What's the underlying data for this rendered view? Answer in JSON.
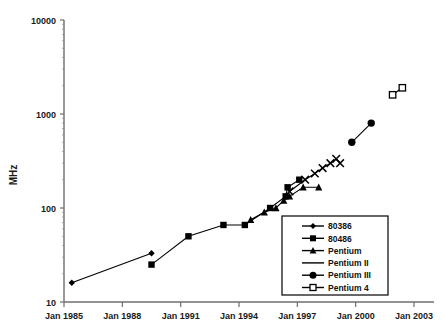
{
  "chart_data": {
    "type": "line",
    "title": "",
    "xlabel": "",
    "ylabel": "MHz",
    "yscale": "log",
    "ylim": [
      10,
      10000
    ],
    "ytick_labels": [
      "10000",
      "1000",
      "100",
      "10"
    ],
    "ytick_values": [
      10000,
      1000,
      100,
      10
    ],
    "xlim": [
      "Jan 1985",
      "Jan 2003"
    ],
    "xtick_labels": [
      "Jan 1985",
      "Jan 1988",
      "Jan 1991",
      "Jan 1994",
      "Jan 1997",
      "Jan 2000",
      "Jan 2003"
    ],
    "xtick_years": [
      1985,
      1988,
      1991,
      1994,
      1997,
      2000,
      2003
    ],
    "grid": false,
    "legend_position": "lower-right",
    "series": [
      {
        "name": "80386",
        "marker": "diamond",
        "points": [
          {
            "year": 1985.4,
            "mhz": 16
          },
          {
            "year": 1989.5,
            "mhz": 33
          }
        ]
      },
      {
        "name": "80486",
        "marker": "square",
        "points": [
          {
            "year": 1989.5,
            "mhz": 25
          },
          {
            "year": 1991.4,
            "mhz": 50
          },
          {
            "year": 1993.2,
            "mhz": 66
          },
          {
            "year": 1994.3,
            "mhz": 66
          },
          {
            "year": 1995.6,
            "mhz": 100
          },
          {
            "year": 1996.4,
            "mhz": 133
          },
          {
            "year": 1996.5,
            "mhz": 166
          },
          {
            "year": 1997.1,
            "mhz": 200
          }
        ]
      },
      {
        "name": "Pentium",
        "marker": "triangle",
        "points": [
          {
            "year": 1994.6,
            "mhz": 75
          },
          {
            "year": 1995.3,
            "mhz": 90
          },
          {
            "year": 1995.9,
            "mhz": 100
          },
          {
            "year": 1996.3,
            "mhz": 120
          },
          {
            "year": 1996.6,
            "mhz": 133
          },
          {
            "year": 1997.3,
            "mhz": 166
          },
          {
            "year": 1998.1,
            "mhz": 166
          }
        ]
      },
      {
        "name": "Pentium II",
        "marker": "cross",
        "points": [
          {
            "year": 1996.6,
            "mhz": 150
          },
          {
            "year": 1997.4,
            "mhz": 200
          },
          {
            "year": 1997.9,
            "mhz": 233
          },
          {
            "year": 1998.3,
            "mhz": 266
          },
          {
            "year": 1998.7,
            "mhz": 300
          },
          {
            "year": 1999.0,
            "mhz": 333
          },
          {
            "year": 1999.2,
            "mhz": 300
          }
        ]
      },
      {
        "name": "Pentium III",
        "marker": "circle",
        "points": [
          {
            "year": 1999.8,
            "mhz": 500
          },
          {
            "year": 2000.8,
            "mhz": 800
          }
        ]
      },
      {
        "name": "Pentium 4",
        "marker": "open-square",
        "points": [
          {
            "year": 2001.9,
            "mhz": 1600
          },
          {
            "year": 2002.4,
            "mhz": 1900
          }
        ]
      }
    ]
  },
  "legend": {
    "items": [
      {
        "label": "80386",
        "marker": "diamond"
      },
      {
        "label": "80486",
        "marker": "square"
      },
      {
        "label": "Pentium",
        "marker": "triangle"
      },
      {
        "label": "Pentium II",
        "marker": "line"
      },
      {
        "label": "Pentium III",
        "marker": "circle"
      },
      {
        "label": "Pentium 4",
        "marker": "open-square"
      }
    ]
  }
}
